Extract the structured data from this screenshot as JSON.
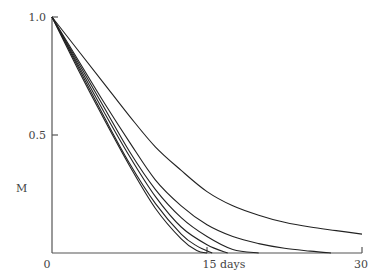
{
  "chart_data": {
    "type": "line",
    "title": "",
    "xlabel": "days",
    "ylabel": "M",
    "xlim": [
      0,
      30
    ],
    "ylim": [
      0,
      1.0
    ],
    "grid": false,
    "legend": null,
    "x_ticks": [
      {
        "value": 0,
        "label": "0"
      },
      {
        "value": 15,
        "label": "15 days"
      },
      {
        "value": 30,
        "label": "30"
      }
    ],
    "y_ticks": [
      {
        "value": 0.5,
        "label": "0.5"
      },
      {
        "value": 1.0,
        "label": "1.0"
      }
    ],
    "x": [
      0,
      5,
      10,
      15,
      20,
      25,
      30
    ],
    "series": [
      {
        "name": "curve-1",
        "points": [
          [
            0,
            1.0
          ],
          [
            2.5,
            0.86
          ],
          [
            5,
            0.72
          ],
          [
            7.5,
            0.58
          ],
          [
            10,
            0.45
          ],
          [
            12.5,
            0.35
          ],
          [
            15,
            0.26
          ],
          [
            17.5,
            0.2
          ],
          [
            20,
            0.16
          ],
          [
            22.5,
            0.13
          ],
          [
            25,
            0.11
          ],
          [
            27.5,
            0.095
          ],
          [
            30,
            0.08
          ]
        ]
      },
      {
        "name": "curve-2",
        "points": [
          [
            0,
            1.0
          ],
          [
            2.5,
            0.82
          ],
          [
            5,
            0.64
          ],
          [
            7.5,
            0.47
          ],
          [
            10,
            0.31
          ],
          [
            12.5,
            0.2
          ],
          [
            15,
            0.12
          ],
          [
            17.5,
            0.07
          ],
          [
            20,
            0.04
          ],
          [
            22.5,
            0.02
          ],
          [
            25,
            0.008
          ],
          [
            27,
            0.0
          ]
        ]
      },
      {
        "name": "curve-3",
        "points": [
          [
            0,
            1.0
          ],
          [
            2.5,
            0.81
          ],
          [
            5,
            0.62
          ],
          [
            7.5,
            0.43
          ],
          [
            10,
            0.27
          ],
          [
            12.5,
            0.15
          ],
          [
            15,
            0.07
          ],
          [
            17.5,
            0.015
          ],
          [
            20,
            0.0
          ]
        ]
      },
      {
        "name": "curve-4",
        "points": [
          [
            0,
            1.0
          ],
          [
            2.5,
            0.8
          ],
          [
            5,
            0.6
          ],
          [
            7.5,
            0.41
          ],
          [
            10,
            0.24
          ],
          [
            12.5,
            0.11
          ],
          [
            15,
            0.035
          ],
          [
            17,
            0.0
          ]
        ]
      },
      {
        "name": "curve-5",
        "points": [
          [
            0,
            1.0
          ],
          [
            2.5,
            0.79
          ],
          [
            5,
            0.58
          ],
          [
            7.5,
            0.38
          ],
          [
            10,
            0.21
          ],
          [
            12.5,
            0.08
          ],
          [
            14,
            0.03
          ],
          [
            15.5,
            0.0
          ]
        ]
      },
      {
        "name": "curve-6",
        "points": [
          [
            0,
            1.0
          ],
          [
            2.5,
            0.78
          ],
          [
            5,
            0.57
          ],
          [
            7.5,
            0.37
          ],
          [
            10,
            0.19
          ],
          [
            12.5,
            0.06
          ],
          [
            14,
            0.01
          ],
          [
            15,
            0.0
          ]
        ]
      }
    ]
  },
  "labels": {
    "y_axis": "M",
    "y_tick_top": "1.0",
    "y_tick_mid": "0.5",
    "x_origin": "0",
    "x_tick_mid": "15 days",
    "x_tick_end": "30"
  }
}
